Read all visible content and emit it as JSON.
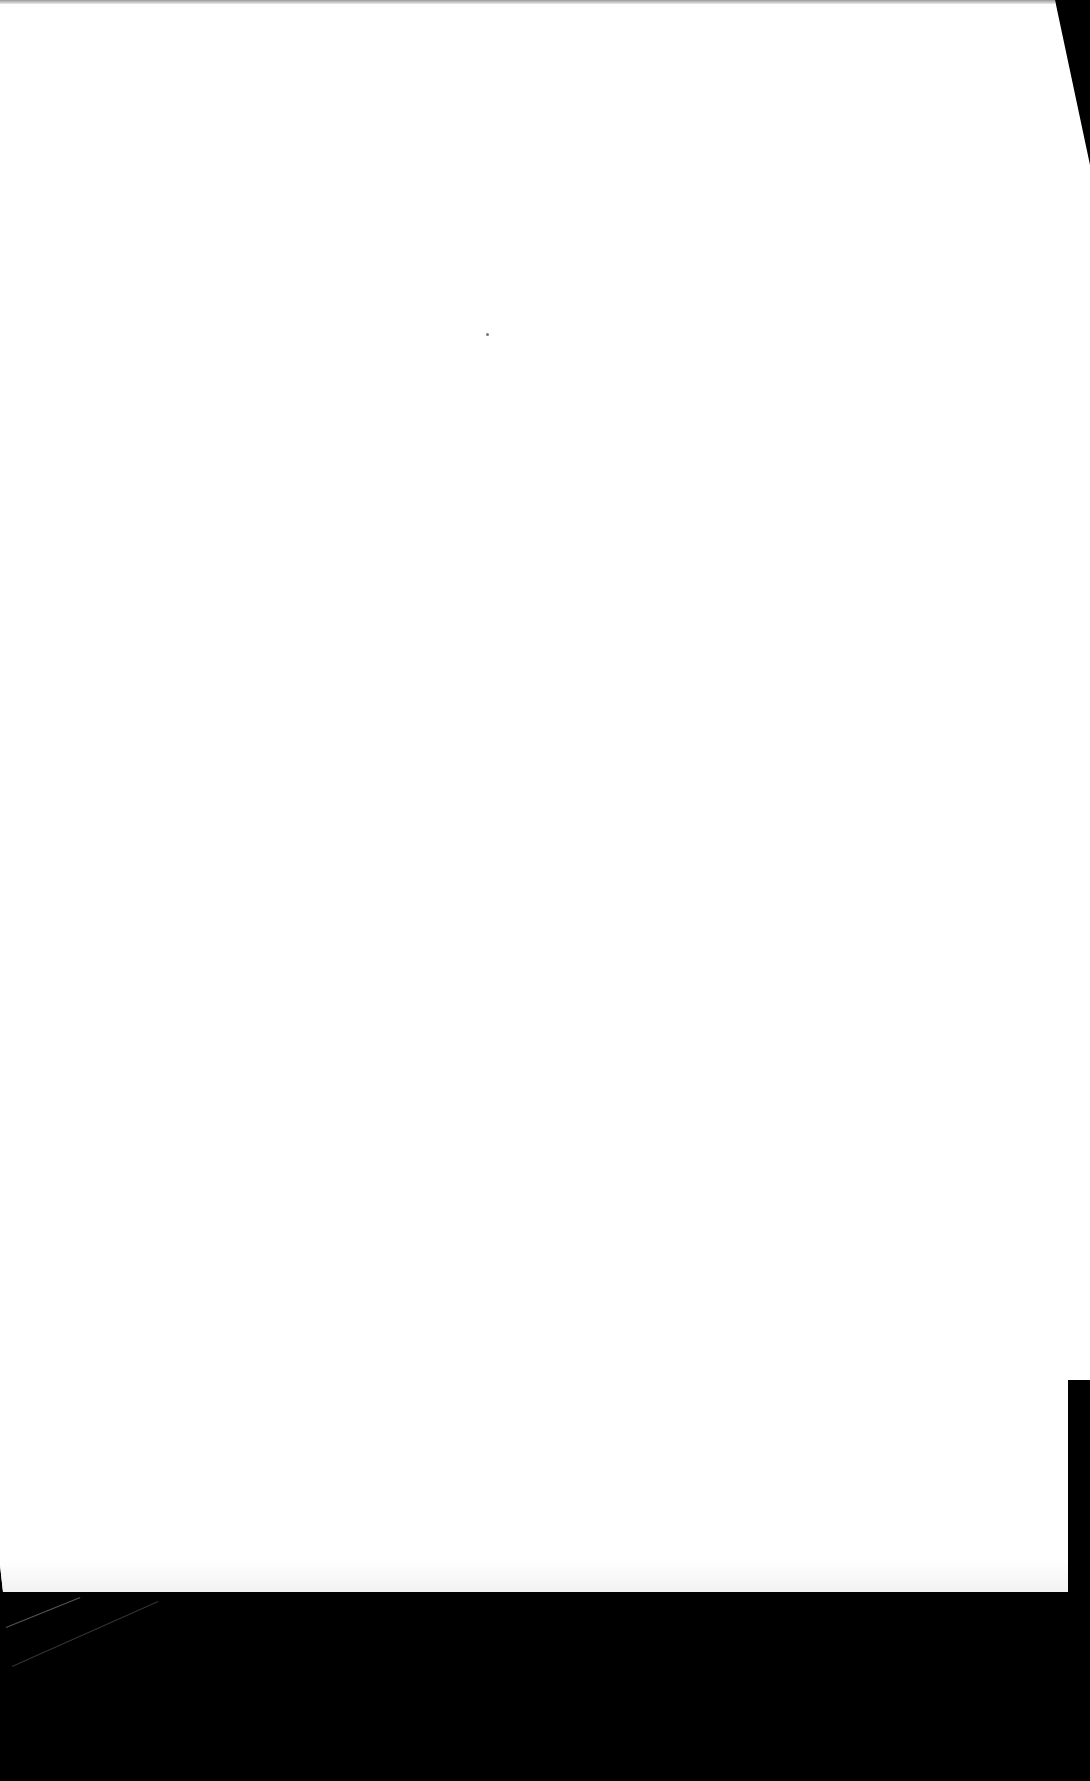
{
  "document": {
    "type": "scanned-page",
    "content": "",
    "background_color": "#000000",
    "page_color": "#ffffff"
  }
}
